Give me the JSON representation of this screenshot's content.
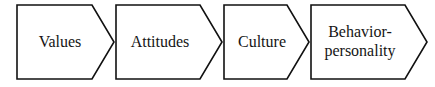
{
  "diagram": {
    "type": "chevron-process-flow",
    "orientation": "left-to-right",
    "step_count": 4,
    "background_color": "#ffffff",
    "outline_color": "#111111",
    "fill_color": "#ffffff",
    "text_color": "#151515",
    "steps": [
      {
        "index": 1,
        "name": "values",
        "label": "Values",
        "lines": [
          "Values"
        ],
        "shape": {
          "left": 17,
          "right": 114,
          "top": 5,
          "bottom": 79,
          "point_depth": 22,
          "notch_depth": 0
        },
        "text_center_x": 60,
        "text_baseline_y": 47
      },
      {
        "index": 2,
        "name": "attitudes",
        "label": "Attitudes",
        "lines": [
          "Attitudes"
        ],
        "shape": {
          "left": 116,
          "right": 222,
          "top": 5,
          "bottom": 79,
          "point_depth": 22,
          "notch_depth": 0
        },
        "text_center_x": 160,
        "text_baseline_y": 47
      },
      {
        "index": 3,
        "name": "culture",
        "label": "Culture",
        "lines": [
          "Culture"
        ],
        "shape": {
          "left": 224,
          "right": 309,
          "top": 5,
          "bottom": 79,
          "point_depth": 22,
          "notch_depth": 0
        },
        "text_center_x": 262,
        "text_baseline_y": 47
      },
      {
        "index": 4,
        "name": "behavior-personality",
        "label": "Behavior-personality",
        "lines": [
          "Behavior-",
          "personality"
        ],
        "shape": {
          "left": 311,
          "right": 427,
          "top": 5,
          "bottom": 79,
          "point_depth": 22,
          "notch_depth": 0
        },
        "text_center_x": 360,
        "text_baseline_y": 37
      }
    ]
  }
}
